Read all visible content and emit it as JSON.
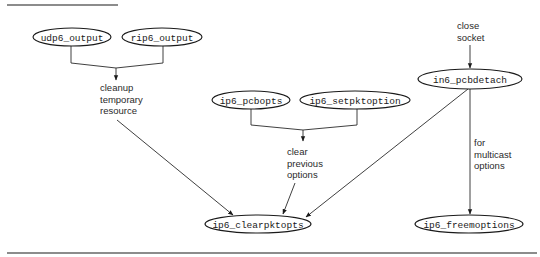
{
  "diagram": {
    "type": "call-graph",
    "nodes": {
      "udp6_output": {
        "label": "udp6_output",
        "cx": 72,
        "cy": 37,
        "rx": 39,
        "ry": 9
      },
      "rip6_output": {
        "label": "rip6_output",
        "cx": 162,
        "cy": 37,
        "rx": 40,
        "ry": 9
      },
      "ip6_pcbopts": {
        "label": "ip6_pcbopts",
        "cx": 251,
        "cy": 100,
        "rx": 39,
        "ry": 9
      },
      "ip6_setpktoption": {
        "label": "ip6_setpktoption",
        "cx": 355,
        "cy": 100,
        "rx": 55,
        "ry": 9
      },
      "in6_pcbdetach": {
        "label": "in6_pcbdetach",
        "cx": 470,
        "cy": 79,
        "rx": 52,
        "ry": 10
      },
      "ip6_clearpktopts": {
        "label": "ip6_clearpktopts",
        "cx": 258,
        "cy": 224,
        "rx": 53,
        "ry": 9
      },
      "ip6_freemoptions": {
        "label": "ip6_freemoptions",
        "cx": 469,
        "cy": 224,
        "rx": 54,
        "ry": 9
      }
    },
    "annotations": {
      "cleanup": {
        "lines": [
          "cleanup",
          "temporary",
          "resource"
        ]
      },
      "clear": {
        "lines": [
          "clear",
          "previous",
          "options"
        ]
      },
      "close": {
        "lines": [
          "close",
          "socket"
        ]
      },
      "multicast": {
        "lines": [
          "for",
          "multicast",
          "options"
        ]
      }
    },
    "edges": [
      {
        "from": [
          "udp6_output",
          "rip6_output"
        ],
        "to": "ip6_clearpktopts",
        "label": "cleanup temporary resource"
      },
      {
        "from": [
          "ip6_pcbopts",
          "ip6_setpktoption"
        ],
        "to": "ip6_clearpktopts",
        "label": "clear previous options"
      },
      {
        "from": "close socket",
        "to": "in6_pcbdetach",
        "label": ""
      },
      {
        "from": "in6_pcbdetach",
        "to": "ip6_clearpktopts",
        "label": ""
      },
      {
        "from": "in6_pcbdetach",
        "to": "ip6_freemoptions",
        "label": "for multicast options"
      }
    ]
  }
}
